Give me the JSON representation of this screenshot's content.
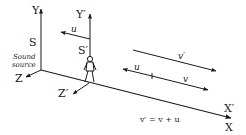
{
  "diagram": {
    "type": "moving-observer-doppler",
    "labels": {
      "y_axis": "Y",
      "z_axis": "Z",
      "x_axis": "X",
      "y_prime_axis": "Y′",
      "z_prime_axis": "Z′",
      "x_prime_axis": "X′",
      "source_frame": "S",
      "observer_frame": "S′",
      "source_line1": "Sound",
      "source_line2": "source",
      "observer_velocity": "u",
      "wave_speed_relative": "v′",
      "wave_speed": "v",
      "velocity_u_on_line": "u",
      "equation": "v′ = v + u"
    },
    "icons": {
      "observer": "stick-figure-person"
    }
  }
}
